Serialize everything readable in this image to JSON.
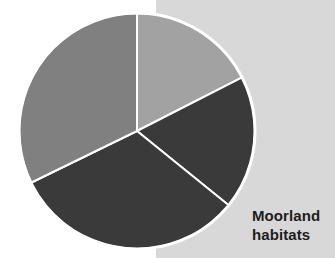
{
  "figure": {
    "caption_lines": [
      "Moorland",
      "habitats"
    ],
    "caption_text": "Moorland habitats",
    "background_left_color": "#ffffff",
    "background_right_color": "#d8d8d8",
    "background_split_x": 156,
    "caption_color": "#1d1d1d"
  },
  "chart_data": {
    "type": "pie",
    "title": "Moorland habitats",
    "xlabel": "",
    "ylabel": "",
    "legend_position": "none",
    "grid": false,
    "start_angle_deg": 0,
    "direction": "clockwise",
    "center": {
      "x": 137,
      "y": 131
    },
    "radius": 118,
    "separator_color": "#ffffff",
    "separator_width": 2,
    "categories": [
      "Segment 1",
      "Segment 2",
      "Segment 3",
      "Segment 4"
    ],
    "values": [
      17.5,
      18.3,
      31.9,
      32.3
    ],
    "slices": [
      {
        "label": "Segment 1",
        "color": "#a2a2a2",
        "start_deg": 0,
        "end_deg": 63,
        "sweep_deg": 63,
        "percent": 17.5
      },
      {
        "label": "Segment 2",
        "color": "#3a3a3a",
        "start_deg": 63,
        "end_deg": 129,
        "sweep_deg": 66,
        "percent": 18.3
      },
      {
        "label": "Segment 3",
        "color": "#3a3a3a",
        "start_deg": 129,
        "end_deg": 244,
        "sweep_deg": 115,
        "percent": 31.9
      },
      {
        "label": "Segment 4",
        "color": "#808080",
        "start_deg": 244,
        "end_deg": 360,
        "sweep_deg": 116,
        "percent": 32.3
      }
    ]
  }
}
